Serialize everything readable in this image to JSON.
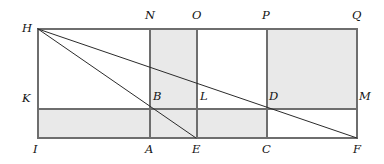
{
  "figure": {
    "type": "geometry-diagram",
    "canvas": {
      "width": 384,
      "height": 164
    },
    "colors": {
      "background": "#ffffff",
      "stroke": "#6e6e6e",
      "diagonal_stroke": "#2b2b2b",
      "shading": "#e9e9e9",
      "label_text": "#121212"
    },
    "strokes": {
      "frame_width": 1.2,
      "grid_width": 1.2,
      "diagonal_width": 1.0
    },
    "geometry": {
      "x_left": 38,
      "x_N": 150,
      "x_E": 196,
      "x_O": 197,
      "x_P": 267,
      "x_right": 357,
      "y_top": 29,
      "y_mid": 109,
      "y_bottom": 138
    },
    "points": [
      {
        "id": "H",
        "label": "H",
        "x": 38,
        "y": 29,
        "label_x": 22,
        "label_y": 23
      },
      {
        "id": "N",
        "label": "N",
        "x": 150,
        "y": 29,
        "label_x": 145,
        "label_y": 10
      },
      {
        "id": "O",
        "label": "O",
        "x": 197,
        "y": 29,
        "label_x": 192,
        "label_y": 10
      },
      {
        "id": "P",
        "label": "P",
        "x": 267,
        "y": 29,
        "label_x": 262,
        "label_y": 10
      },
      {
        "id": "Q",
        "label": "Q",
        "x": 357,
        "y": 29,
        "label_x": 352,
        "label_y": 10
      },
      {
        "id": "K",
        "label": "K",
        "x": 38,
        "y": 109,
        "label_x": 22,
        "label_y": 93
      },
      {
        "id": "B",
        "label": "B",
        "x": 150,
        "y": 109,
        "label_x": 153,
        "label_y": 91
      },
      {
        "id": "L",
        "label": "L",
        "x": 197,
        "y": 109,
        "label_x": 200,
        "label_y": 91
      },
      {
        "id": "D",
        "label": "D",
        "x": 267,
        "y": 109,
        "label_x": 269,
        "label_y": 91
      },
      {
        "id": "M",
        "label": "M",
        "x": 357,
        "y": 109,
        "label_x": 359,
        "label_y": 91
      },
      {
        "id": "I",
        "label": "I",
        "x": 38,
        "y": 138,
        "label_x": 33,
        "label_y": 144
      },
      {
        "id": "A",
        "label": "A",
        "x": 150,
        "y": 138,
        "label_x": 145,
        "label_y": 144
      },
      {
        "id": "E",
        "label": "E",
        "x": 196,
        "y": 138,
        "label_x": 192,
        "label_y": 144
      },
      {
        "id": "C",
        "label": "C",
        "x": 267,
        "y": 138,
        "label_x": 262,
        "label_y": 144
      },
      {
        "id": "F",
        "label": "F",
        "x": 357,
        "y": 138,
        "label_x": 353,
        "label_y": 144
      }
    ],
    "shaded_regions": [
      {
        "id": "cell-N-O-top",
        "x": 150,
        "y": 29,
        "width": 47,
        "height": 80,
        "corners": "N O L B"
      },
      {
        "id": "cell-P-Q-top",
        "x": 267,
        "y": 29,
        "width": 90,
        "height": 80,
        "corners": "P Q M D"
      },
      {
        "id": "strip-I-C-bottom",
        "x": 38,
        "y": 109,
        "width": 229,
        "height": 29,
        "corners": "K D C I"
      }
    ],
    "frame": {
      "id": "outer-rectangle",
      "corners": "H Q F I",
      "x": 38,
      "y": 29,
      "width": 319,
      "height": 109
    },
    "grid_lines": [
      {
        "id": "line-N-A",
        "orientation": "vertical",
        "from": "N",
        "to": "A",
        "x1": 150,
        "y1": 29,
        "x2": 150,
        "y2": 138
      },
      {
        "id": "line-O-E",
        "orientation": "vertical",
        "from": "O",
        "to": "E",
        "x1": 197,
        "y1": 29,
        "x2": 197,
        "y2": 138
      },
      {
        "id": "line-P-C",
        "orientation": "vertical",
        "from": "P",
        "to": "C",
        "x1": 267,
        "y1": 29,
        "x2": 267,
        "y2": 138
      },
      {
        "id": "line-K-M",
        "orientation": "horizontal",
        "from": "K",
        "to": "M",
        "x1": 38,
        "y1": 109,
        "x2": 357,
        "y2": 109
      }
    ],
    "diagonals": [
      {
        "id": "segment-H-F",
        "from": "H",
        "to": "F",
        "x1": 38,
        "y1": 29,
        "x2": 357,
        "y2": 138,
        "passes_through": "D"
      },
      {
        "id": "segment-H-E",
        "from": "H",
        "to": "E",
        "x1": 38,
        "y1": 29,
        "x2": 196,
        "y2": 138,
        "passes_through": "B"
      }
    ]
  }
}
